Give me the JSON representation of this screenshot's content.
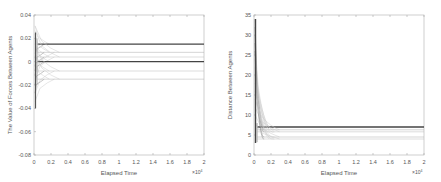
{
  "chart_data": [
    {
      "type": "line",
      "title": "",
      "xlabel": "Elapsed Time",
      "ylabel": "The Value of Forces Between Agents",
      "x_multiplier": "×10^4",
      "xlim": [
        0,
        2
      ],
      "ylim": [
        -0.08,
        0.04
      ],
      "xticks": [
        "0",
        "0.2",
        "0.4",
        "0.6",
        "0.8",
        "1",
        "1.2",
        "1.4",
        "1.6",
        "1.8",
        "2"
      ],
      "yticks": [
        "0.04",
        "0.02",
        "0",
        "-0.02",
        "-0.04",
        "-0.06",
        "-0.08"
      ],
      "grid": false,
      "series_description": "Many agent force trajectories oscillate near t=0 then converge to steady values",
      "steady_values": [
        0.015,
        0.008,
        0.004,
        0.0,
        -0.008,
        -0.015
      ],
      "thick_lines": [
        0.015,
        0.0
      ],
      "initial_range": [
        -0.04,
        0.025
      ]
    },
    {
      "type": "line",
      "title": "",
      "xlabel": "Elapsed Time",
      "ylabel": "Distance Between Agents",
      "x_multiplier": "×10^4",
      "xlim": [
        0,
        2
      ],
      "ylim": [
        0,
        35
      ],
      "xticks": [
        "0",
        "0.2",
        "0.4",
        "0.6",
        "0.8",
        "1",
        "1.2",
        "1.4",
        "1.6",
        "1.8",
        "2"
      ],
      "yticks": [
        "35",
        "30",
        "25",
        "20",
        "15",
        "10",
        "5",
        "0"
      ],
      "grid": false,
      "series_description": "Distances start up to ~34 and quickly converge to steady values",
      "steady_values": [
        7.0,
        6.3,
        5.8,
        4.5,
        4.0
      ],
      "thick_lines": [
        7.0
      ],
      "initial_max": 34
    }
  ]
}
